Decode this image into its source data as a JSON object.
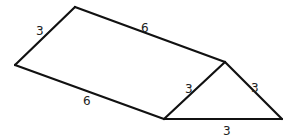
{
  "diagram": {
    "vertices": {
      "A": [
        75,
        7
      ],
      "B": [
        15,
        65
      ],
      "C": [
        164,
        119
      ],
      "D": [
        225,
        62
      ],
      "E": [
        282,
        119
      ]
    },
    "edges": [
      {
        "from": "A",
        "to": "B",
        "label": "3",
        "label_pos": [
          40,
          34
        ]
      },
      {
        "from": "A",
        "to": "D",
        "label": "6",
        "label_pos": [
          145,
          31
        ]
      },
      {
        "from": "B",
        "to": "C",
        "label": "6",
        "label_pos": [
          87,
          104
        ]
      },
      {
        "from": "C",
        "to": "D",
        "label": "3",
        "label_pos": [
          189,
          92
        ]
      },
      {
        "from": "D",
        "to": "E",
        "label": "3",
        "label_pos": [
          255,
          91
        ]
      },
      {
        "from": "C",
        "to": "E",
        "label": "3",
        "label_pos": [
          227,
          134
        ]
      }
    ],
    "line_color": "#111111",
    "label_color": "#222222"
  }
}
